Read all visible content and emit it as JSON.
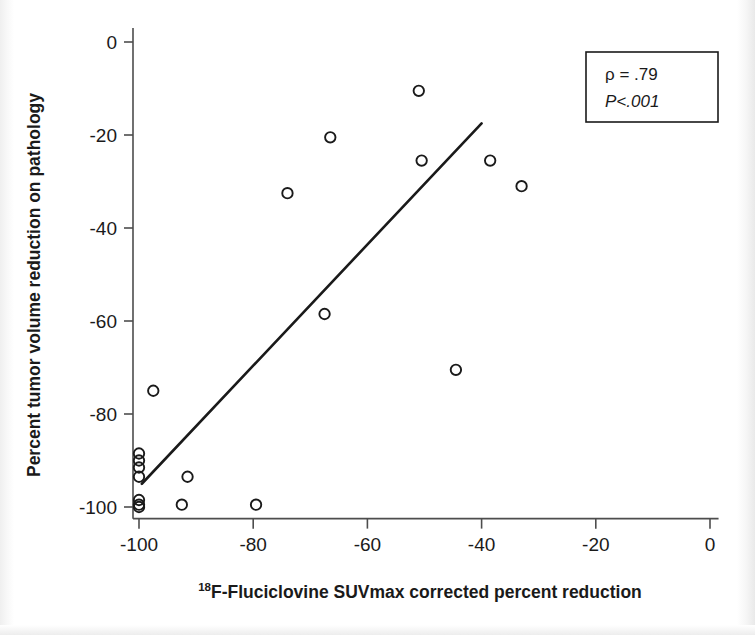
{
  "chart_data": {
    "type": "scatter",
    "title": "",
    "xlabel": "18F-Fluciclovine SUVmax corrected percent reduction",
    "xlabel_superscript": "18",
    "xlabel_rest": "F-Fluciclovine SUVmax corrected percent reduction",
    "ylabel": "Percent tumor volume reduction on pathology",
    "xlim": [
      -105,
      2
    ],
    "ylim": [
      -103,
      3
    ],
    "xticks": [
      -100,
      -80,
      -60,
      -40,
      -20,
      0
    ],
    "xtick_labels": [
      "-100",
      "-80",
      "-60",
      "-40",
      "-20",
      "0"
    ],
    "yticks": [
      0,
      -20,
      -40,
      -60,
      -80,
      -100
    ],
    "ytick_labels": [
      "0",
      "-20",
      "-40",
      "-60",
      "-80",
      "-100"
    ],
    "grid": false,
    "legend": null,
    "marker": "open-circle",
    "marker_color": "#1a1a1a",
    "points": [
      {
        "x": -100.0,
        "y": -88.5
      },
      {
        "x": -100.0,
        "y": -90.0
      },
      {
        "x": -100.0,
        "y": -91.5
      },
      {
        "x": -100.0,
        "y": -93.5
      },
      {
        "x": -100.0,
        "y": -98.5
      },
      {
        "x": -100.0,
        "y": -99.5
      },
      {
        "x": -100.0,
        "y": -100.0
      },
      {
        "x": -97.5,
        "y": -75.0
      },
      {
        "x": -92.5,
        "y": -99.5
      },
      {
        "x": -91.5,
        "y": -93.5
      },
      {
        "x": -79.5,
        "y": -99.5
      },
      {
        "x": -74.0,
        "y": -32.5
      },
      {
        "x": -67.5,
        "y": -58.5
      },
      {
        "x": -66.5,
        "y": -20.5
      },
      {
        "x": -51.0,
        "y": -10.5
      },
      {
        "x": -50.5,
        "y": -25.5
      },
      {
        "x": -44.5,
        "y": -70.5
      },
      {
        "x": -38.5,
        "y": -25.5
      },
      {
        "x": -33.0,
        "y": -31.0
      }
    ],
    "trendline": {
      "type": "linear-fit",
      "x_start": -99.5,
      "y_start": -95.0,
      "x_end": -40.0,
      "y_end": -17.5,
      "color": "#1a1a1a",
      "width": 2.6
    },
    "annotations": {
      "stats_box": {
        "rho_label": "ρ  =  .79",
        "p_label": "P<.001",
        "border_color": "#1a1a1a"
      }
    }
  },
  "axes": {
    "axis_color": "#4d4d4d",
    "tick_length": 8
  }
}
